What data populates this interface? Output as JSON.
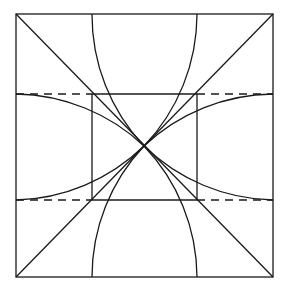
{
  "diagram": {
    "type": "geometric-construction",
    "stroke_color": "#1a1a1a",
    "background": "#ffffff",
    "outer_square": {
      "x1": 16,
      "y1": 14,
      "x2": 273,
      "y2": 277
    },
    "inner_square": {
      "x1": 92,
      "y1": 94,
      "x2": 197,
      "y2": 200
    },
    "center": {
      "x": 144,
      "y": 146
    },
    "arc_radius": 191,
    "dashed_lines": [
      {
        "y": 94,
        "from": 16,
        "to": 92
      },
      {
        "y": 94,
        "from": 197,
        "to": 273
      },
      {
        "y": 200,
        "from": 16,
        "to": 92
      },
      {
        "y": 200,
        "from": 197,
        "to": 273
      }
    ],
    "labels": []
  }
}
